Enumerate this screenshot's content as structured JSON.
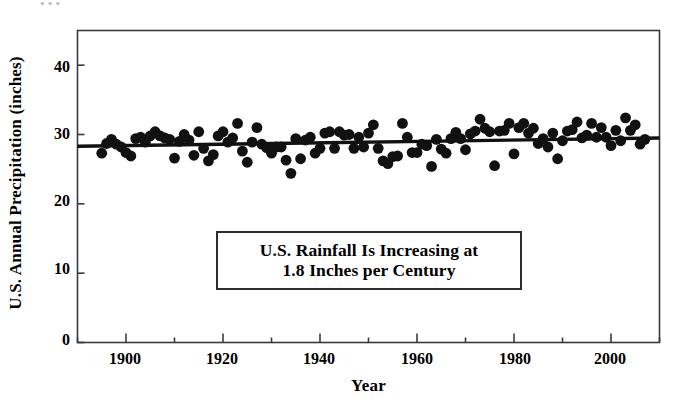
{
  "chart_data": {
    "type": "scatter",
    "title": "",
    "xlabel": "Year",
    "ylabel": "U.S. Annual Precipitation (inches)",
    "xlim": [
      1890,
      2010
    ],
    "ylim": [
      0,
      45
    ],
    "grid": false,
    "legend": null,
    "x_ticks": [
      1900,
      1920,
      1940,
      1960,
      1980,
      2000
    ],
    "x_minor_tick_interval": 10,
    "y_ticks": [
      0,
      10,
      20,
      30,
      40
    ],
    "marker": "filled-circle",
    "marker_color": "#111111",
    "annotations": [
      {
        "name": "trend-annotation",
        "lines": [
          "U.S. Rainfall Is Increasing at",
          "1.8 Inches per Century"
        ],
        "boxed": true
      }
    ],
    "trendline": {
      "name": "linear-trend",
      "color": "#111111",
      "slope_inches_per_century": 1.8,
      "x": [
        1890,
        2010
      ],
      "y": [
        28.3,
        29.5
      ]
    },
    "series": [
      {
        "name": "U.S. Annual Precipitation",
        "x": [
          1895,
          1896,
          1897,
          1898,
          1899,
          1900,
          1901,
          1902,
          1903,
          1904,
          1905,
          1906,
          1907,
          1908,
          1909,
          1910,
          1911,
          1912,
          1913,
          1914,
          1915,
          1916,
          1917,
          1918,
          1919,
          1920,
          1921,
          1922,
          1923,
          1924,
          1925,
          1926,
          1927,
          1928,
          1929,
          1930,
          1931,
          1932,
          1933,
          1934,
          1935,
          1936,
          1937,
          1938,
          1939,
          1940,
          1941,
          1942,
          1943,
          1944,
          1945,
          1946,
          1947,
          1948,
          1949,
          1950,
          1951,
          1952,
          1953,
          1954,
          1955,
          1956,
          1957,
          1958,
          1959,
          1960,
          1961,
          1962,
          1963,
          1964,
          1965,
          1966,
          1967,
          1968,
          1969,
          1970,
          1971,
          1972,
          1973,
          1974,
          1975,
          1976,
          1977,
          1978,
          1979,
          1980,
          1981,
          1982,
          1983,
          1984,
          1985,
          1986,
          1987,
          1988,
          1989,
          1990,
          1991,
          1992,
          1993,
          1994,
          1995,
          1996,
          1997,
          1998,
          1999,
          2000,
          2001,
          2002,
          2003,
          2004,
          2005,
          2006,
          2007
        ],
        "y": [
          27.3,
          28.7,
          29.3,
          28.6,
          28.2,
          27.4,
          26.9,
          29.4,
          29.6,
          28.9,
          29.8,
          30.4,
          29.8,
          29.5,
          29.3,
          26.6,
          29.0,
          30.0,
          29.2,
          27.0,
          30.4,
          28.0,
          26.2,
          27.1,
          29.8,
          30.4,
          28.9,
          29.5,
          31.6,
          27.6,
          26.0,
          28.9,
          31.0,
          28.6,
          28.1,
          27.3,
          28.2,
          28.2,
          26.3,
          24.4,
          29.4,
          26.5,
          29.2,
          29.6,
          27.3,
          28.0,
          30.2,
          30.4,
          28.0,
          30.4,
          29.9,
          30.0,
          28.0,
          29.6,
          28.2,
          30.2,
          31.4,
          28.0,
          26.2,
          25.8,
          26.8,
          26.9,
          31.6,
          29.6,
          27.4,
          27.4,
          28.6,
          28.4,
          25.4,
          29.3,
          27.9,
          27.3,
          29.4,
          30.3,
          29.4,
          27.8,
          30.1,
          30.5,
          32.2,
          30.9,
          30.4,
          25.5,
          30.5,
          30.6,
          31.6,
          27.2,
          31.0,
          31.6,
          30.2,
          30.9,
          28.7,
          29.4,
          28.2,
          30.2,
          26.5,
          29.1,
          30.5,
          30.7,
          31.8,
          29.5,
          29.9,
          31.6,
          29.6,
          31.0,
          29.6,
          28.4,
          30.6,
          29.1,
          32.4,
          30.6,
          31.4,
          28.6,
          29.3
        ]
      }
    ]
  },
  "axis": {
    "y_title": "U.S. Annual Precipitation (inches)",
    "x_title": "Year",
    "y_ticks": [
      "40",
      "30",
      "20",
      "10",
      "0"
    ],
    "x_ticks": [
      "1900",
      "1920",
      "1940",
      "1960",
      "1980",
      "2000"
    ]
  },
  "annotation": {
    "line1": "U.S. Rainfall Is Increasing at",
    "line2": "1.8 Inches per Century"
  },
  "artifacts": {
    "top_edge": "•  •          •"
  }
}
